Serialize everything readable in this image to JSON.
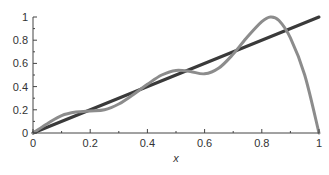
{
  "chart_data": {
    "type": "line",
    "title": "",
    "xlabel": "x",
    "ylabel": "",
    "xlim": [
      0,
      1
    ],
    "ylim": [
      0,
      1
    ],
    "grid": false,
    "legend": null,
    "x_ticks": [
      "0",
      "0.2",
      "0.4",
      "0.6",
      "0.8",
      "1"
    ],
    "y_ticks": [
      "0",
      "0.2",
      "0.4",
      "0.6",
      "0.8",
      "1"
    ],
    "series": [
      {
        "name": "linear",
        "color": "#3a3a3a",
        "x": [
          0,
          1
        ],
        "y": [
          0,
          1
        ]
      },
      {
        "name": "oscillating",
        "color": "#8c8c8c",
        "x": [
          0,
          0.05,
          0.1,
          0.15,
          0.2,
          0.25,
          0.3,
          0.35,
          0.4,
          0.45,
          0.5,
          0.55,
          0.6,
          0.65,
          0.7,
          0.75,
          0.8,
          0.83,
          0.86,
          0.9,
          0.95,
          1.0
        ],
        "y": [
          0,
          0.08,
          0.15,
          0.18,
          0.19,
          0.2,
          0.25,
          0.33,
          0.42,
          0.5,
          0.54,
          0.53,
          0.51,
          0.56,
          0.68,
          0.83,
          0.96,
          1.0,
          0.97,
          0.82,
          0.5,
          0.0
        ]
      }
    ]
  }
}
